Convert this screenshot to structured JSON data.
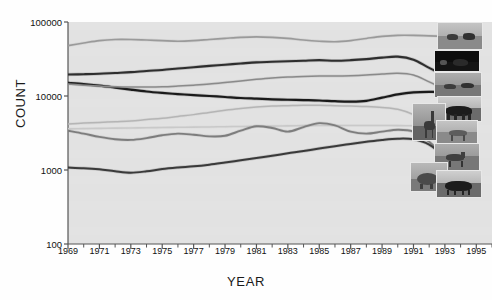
{
  "chart_data": {
    "type": "line",
    "title": "",
    "xlabel": "YEAR",
    "ylabel": "COUNT",
    "yscale": "log",
    "ylim": [
      100,
      100000
    ],
    "xlim": [
      1969,
      1996
    ],
    "grid": false,
    "legend": "none",
    "ytick_labels": [
      "100000",
      "10000",
      "1000",
      "100"
    ],
    "ytick_values": [
      100000,
      10000,
      1000,
      100
    ],
    "xtick_labels": [
      "1969",
      "1971",
      "1973",
      "1975",
      "1977",
      "1979",
      "1981",
      "1983",
      "1985",
      "1987",
      "1989",
      "1991",
      "1993",
      "1995"
    ],
    "xtick_values": [
      1969,
      1971,
      1973,
      1975,
      1977,
      1979,
      1981,
      1983,
      1985,
      1987,
      1989,
      1991,
      1993,
      1995
    ],
    "x": [
      1969,
      1970,
      1971,
      1972,
      1973,
      1974,
      1975,
      1976,
      1977,
      1978,
      1979,
      1980,
      1981,
      1982,
      1983,
      1984,
      1985,
      1986,
      1987,
      1988,
      1989,
      1990,
      1991,
      1992,
      1993,
      1994,
      1995
    ],
    "series": [
      {
        "name": "series-1-impala",
        "color": "#9a9a9a",
        "width": 1.6,
        "values": [
          48000,
          52000,
          56000,
          58000,
          58000,
          57000,
          56000,
          55000,
          56000,
          58000,
          60000,
          62000,
          63000,
          62000,
          60000,
          57000,
          55000,
          54000,
          56000,
          60000,
          64000,
          66000,
          66000,
          65000,
          64000,
          63000,
          62000
        ]
      },
      {
        "name": "series-2-zebra",
        "color": "#2e2e2e",
        "width": 2.1,
        "values": [
          19500,
          19700,
          20000,
          20500,
          21000,
          21800,
          22500,
          23500,
          24500,
          25500,
          26500,
          27500,
          28500,
          29000,
          29500,
          30000,
          30500,
          30000,
          30500,
          31500,
          33000,
          34000,
          31000,
          24000,
          19000,
          16500,
          16000
        ]
      },
      {
        "name": "series-3-wildebeest",
        "color": "#1a1a1a",
        "width": 2.2,
        "values": [
          15000,
          14500,
          13800,
          13000,
          12200,
          11500,
          11000,
          10600,
          10300,
          10000,
          9700,
          9400,
          9200,
          9000,
          8900,
          8800,
          8700,
          8500,
          8400,
          8600,
          9500,
          10500,
          11200,
          11400,
          11300,
          11000,
          10800
        ]
      },
      {
        "name": "series-4-buffalo",
        "color": "#8a8a8a",
        "width": 1.5,
        "values": [
          14500,
          14000,
          13600,
          13300,
          13200,
          13200,
          13300,
          13600,
          14000,
          14500,
          15200,
          16000,
          16800,
          17500,
          18000,
          18400,
          18600,
          18600,
          18800,
          19200,
          19800,
          20300,
          19200,
          15500,
          12500,
          11500,
          11400
        ]
      },
      {
        "name": "series-5-giraffe",
        "color": "#b5b5b5",
        "width": 1.5,
        "values": [
          4200,
          4300,
          4400,
          4500,
          4600,
          4800,
          5000,
          5300,
          5600,
          6000,
          6400,
          6800,
          7100,
          7300,
          7400,
          7500,
          7500,
          7400,
          7300,
          7200,
          7000,
          6600,
          5600,
          4200,
          3200,
          2900,
          3000
        ]
      },
      {
        "name": "series-6-eland",
        "color": "#c9c9c9",
        "width": 1.6,
        "values": [
          3600,
          3620,
          3650,
          3680,
          3700,
          3720,
          3750,
          3780,
          3800,
          3820,
          3850,
          3880,
          3900,
          3920,
          3950,
          3980,
          4000,
          4000,
          4000,
          4000,
          3990,
          3980,
          3960,
          3950,
          3940,
          3930,
          3920
        ]
      },
      {
        "name": "series-7-topi",
        "color": "#7d7d7d",
        "width": 1.9,
        "values": [
          3400,
          3100,
          2800,
          2600,
          2550,
          2700,
          2950,
          3100,
          3000,
          2850,
          2900,
          3400,
          3900,
          3700,
          3300,
          3800,
          4300,
          4000,
          3300,
          3100,
          3300,
          3500,
          3300,
          2400,
          1500,
          800,
          640
        ]
      },
      {
        "name": "series-8-elephant",
        "color": "#3a3a3a",
        "width": 2.0,
        "values": [
          1080,
          1060,
          1020,
          960,
          920,
          960,
          1030,
          1080,
          1120,
          1180,
          1260,
          1350,
          1450,
          1560,
          1680,
          1800,
          1950,
          2100,
          2250,
          2400,
          2550,
          2650,
          2600,
          2200,
          1500,
          900,
          700
        ]
      }
    ]
  },
  "thumbnails": [
    {
      "name": "thumb-impala",
      "left": 437,
      "top": 22,
      "width": 46,
      "height": 28,
      "kind": "herd-light"
    },
    {
      "name": "thumb-zebra",
      "left": 434,
      "top": 50,
      "width": 46,
      "height": 22,
      "kind": "night-dark"
    },
    {
      "name": "thumb-wildebeest",
      "left": 434,
      "top": 72,
      "width": 48,
      "height": 26,
      "kind": "herd-mid"
    },
    {
      "name": "thumb-buffalo",
      "left": 437,
      "top": 96,
      "width": 45,
      "height": 26,
      "kind": "bull-dark"
    },
    {
      "name": "thumb-giraffe",
      "left": 412,
      "top": 103,
      "width": 34,
      "height": 38,
      "kind": "giraffe"
    },
    {
      "name": "thumb-eland",
      "left": 436,
      "top": 120,
      "width": 42,
      "height": 24,
      "kind": "antelope-light"
    },
    {
      "name": "thumb-topi",
      "left": 434,
      "top": 143,
      "width": 46,
      "height": 28,
      "kind": "topi"
    },
    {
      "name": "thumb-elephant",
      "left": 410,
      "top": 162,
      "width": 38,
      "height": 30,
      "kind": "elephant"
    },
    {
      "name": "thumb-rhino",
      "left": 436,
      "top": 170,
      "width": 46,
      "height": 28,
      "kind": "rhino"
    }
  ]
}
